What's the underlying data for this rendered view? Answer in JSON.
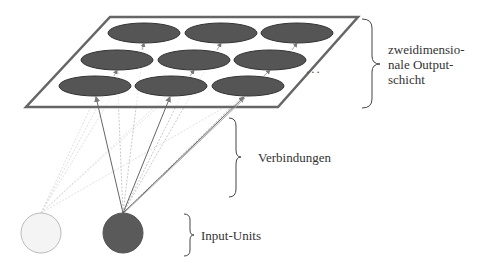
{
  "labels": {
    "output_layer": [
      "zweidimensio-",
      "nale Output-",
      "schicht"
    ],
    "connections": "Verbindungen",
    "inputs": "Input-Units",
    "ellipsis": "..."
  },
  "colors": {
    "unit_fill": "#555555",
    "unit_stroke": "#333333",
    "plane_stroke": "#666666",
    "input_light_fill": "#f4f4f4",
    "input_light_stroke": "#bbbbbb",
    "input_dark_fill": "#5a5a5a",
    "arrow": "#666666",
    "arrow_faint": "#cccccc"
  },
  "grid": {
    "rows": 3,
    "cols": 3
  }
}
